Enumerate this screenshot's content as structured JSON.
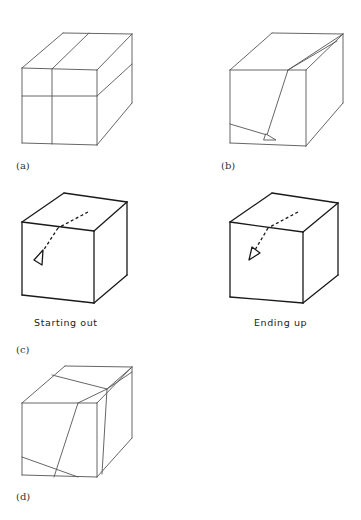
{
  "figure": {
    "panels": [
      {
        "id": "a",
        "label": "(a)",
        "label_pos": [
          16,
          161
        ],
        "stroke": "#555555",
        "stroke_width": 0.9,
        "edges": [
          [
            [
              22,
              68
            ],
            [
              97,
              70
            ]
          ],
          [
            [
              97,
              70
            ],
            [
              97,
              145
            ]
          ],
          [
            [
              97,
              145
            ],
            [
              22,
              143
            ]
          ],
          [
            [
              22,
              143
            ],
            [
              22,
              68
            ]
          ],
          [
            [
              22,
              68
            ],
            [
              63,
              33
            ]
          ],
          [
            [
              63,
              33
            ],
            [
              132,
              34
            ]
          ],
          [
            [
              132,
              34
            ],
            [
              97,
              70
            ]
          ],
          [
            [
              132,
              34
            ],
            [
              132,
              103
            ]
          ],
          [
            [
              132,
              103
            ],
            [
              97,
              145
            ]
          ],
          [
            [
              52,
              69
            ],
            [
              52,
              144
            ]
          ],
          [
            [
              52,
              69
            ],
            [
              89,
              33
            ]
          ],
          [
            [
              22,
              96
            ],
            [
              97,
              96
            ]
          ],
          [
            [
              97,
              96
            ],
            [
              132,
              64
            ]
          ]
        ]
      },
      {
        "id": "b",
        "label": "(b)",
        "label_pos": [
          221,
          161
        ],
        "stroke": "#555555",
        "stroke_width": 0.9,
        "edges": [
          [
            [
              230,
              70
            ],
            [
              306,
              70
            ]
          ],
          [
            [
              306,
              70
            ],
            [
              306,
              146
            ]
          ],
          [
            [
              306,
              146
            ],
            [
              230,
              143
            ]
          ],
          [
            [
              230,
              143
            ],
            [
              230,
              70
            ]
          ],
          [
            [
              230,
              70
            ],
            [
              272,
              33
            ]
          ],
          [
            [
              272,
              33
            ],
            [
              343,
              34
            ]
          ],
          [
            [
              343,
              34
            ],
            [
              306,
              70
            ]
          ],
          [
            [
              343,
              34
            ],
            [
              343,
              103
            ]
          ],
          [
            [
              343,
              103
            ],
            [
              306,
              146
            ]
          ],
          [
            [
              288,
              70
            ],
            [
              343,
              34
            ]
          ],
          [
            [
              288,
              70
            ],
            [
              337,
              41
            ]
          ],
          [
            [
              288,
              70
            ],
            [
              267,
              135
            ]
          ],
          [
            [
              230,
              124
            ],
            [
              267,
              135
            ]
          ]
        ],
        "triangles": [
          [
            [
              266,
              134
            ],
            [
              276,
              140
            ],
            [
              264,
              140
            ]
          ]
        ]
      },
      {
        "id": "c",
        "label": "(c)",
        "label_pos": [
          16,
          345
        ],
        "caption": "Starting out",
        "caption_pos": [
          34,
          318
        ],
        "stroke": "#1a1a1a",
        "stroke_width": 1.3,
        "edges": [
          [
            [
              22,
              222
            ],
            [
              94,
              231
            ]
          ],
          [
            [
              94,
              231
            ],
            [
              94,
              303
            ]
          ],
          [
            [
              94,
              303
            ],
            [
              22,
              295
            ]
          ],
          [
            [
              22,
              295
            ],
            [
              22,
              222
            ]
          ],
          [
            [
              22,
              222
            ],
            [
              64,
              193
            ]
          ],
          [
            [
              64,
              193
            ],
            [
              127,
              202
            ]
          ],
          [
            [
              127,
              202
            ],
            [
              94,
              231
            ]
          ],
          [
            [
              127,
              202
            ],
            [
              127,
              275
            ]
          ],
          [
            [
              127,
              275
            ],
            [
              94,
              303
            ]
          ]
        ],
        "dashed": [
          [
            [
              88,
              212
            ],
            [
              58,
              228
            ]
          ],
          [
            [
              58,
              228
            ],
            [
              43,
              251
            ]
          ]
        ],
        "triangles": [
          [
            [
              43,
              250
            ],
            [
              34,
              260
            ],
            [
              42,
              265
            ]
          ]
        ]
      },
      {
        "id": "c2",
        "label": "",
        "caption": "Ending up",
        "caption_pos": [
          254,
          318
        ],
        "stroke": "#1a1a1a",
        "stroke_width": 1.3,
        "edges": [
          [
            [
              230,
              222
            ],
            [
              303,
              232
            ]
          ],
          [
            [
              303,
              232
            ],
            [
              303,
              303
            ]
          ],
          [
            [
              303,
              303
            ],
            [
              230,
              297
            ]
          ],
          [
            [
              230,
              297
            ],
            [
              230,
              222
            ]
          ],
          [
            [
              230,
              222
            ],
            [
              272,
              193
            ]
          ],
          [
            [
              272,
              193
            ],
            [
              338,
              203
            ]
          ],
          [
            [
              338,
              203
            ],
            [
              303,
              232
            ]
          ],
          [
            [
              338,
              203
            ],
            [
              338,
              275
            ]
          ],
          [
            [
              338,
              275
            ],
            [
              303,
              303
            ]
          ]
        ],
        "dashed": [
          [
            [
              298,
              212
            ],
            [
              268,
              228
            ]
          ],
          [
            [
              268,
              228
            ],
            [
              255,
              250
            ]
          ]
        ],
        "triangles": [
          [
            [
              252,
              247
            ],
            [
              260,
              253
            ],
            [
              249,
              260
            ]
          ]
        ]
      },
      {
        "id": "d",
        "label": "(d)",
        "label_pos": [
          16,
          492
        ],
        "stroke": "#555555",
        "stroke_width": 0.9,
        "edges": [
          [
            [
              22,
              403
            ],
            [
              97,
              403
            ]
          ],
          [
            [
              97,
              403
            ],
            [
              97,
              477
            ]
          ],
          [
            [
              97,
              477
            ],
            [
              22,
              475
            ]
          ],
          [
            [
              22,
              475
            ],
            [
              22,
              403
            ]
          ],
          [
            [
              22,
              403
            ],
            [
              65,
              366
            ]
          ],
          [
            [
              65,
              366
            ],
            [
              132,
              367
            ]
          ],
          [
            [
              132,
              367
            ],
            [
              97,
              403
            ]
          ],
          [
            [
              132,
              367
            ],
            [
              132,
              438
            ]
          ],
          [
            [
              132,
              438
            ],
            [
              97,
              477
            ]
          ],
          [
            [
              52,
              375
            ],
            [
              107,
              389
            ]
          ],
          [
            [
              78,
              403
            ],
            [
              107,
              389
            ]
          ],
          [
            [
              107,
              389
            ],
            [
              132,
              367
            ]
          ],
          [
            [
              107,
              389
            ],
            [
              132,
              372
            ]
          ],
          [
            [
              107,
              389
            ],
            [
              102,
              474
            ]
          ],
          [
            [
              78,
              403
            ],
            [
              54,
              477
            ]
          ],
          [
            [
              22,
              457
            ],
            [
              78,
              477
            ]
          ]
        ]
      }
    ]
  }
}
